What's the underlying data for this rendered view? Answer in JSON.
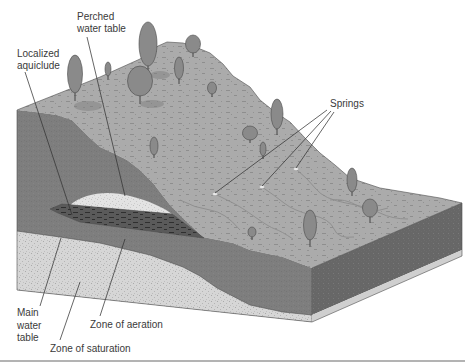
{
  "figure": {
    "labels": {
      "perched_water_table": {
        "line1": "Perched",
        "line2": "water table"
      },
      "localized_aquiclude": {
        "line1": "Localized",
        "line2": "aquiclude"
      },
      "springs": "Springs",
      "main_water_table": {
        "line1": "Main",
        "line2": "water",
        "line3": "table"
      },
      "zone_of_aeration": "Zone of aeration",
      "zone_of_saturation": "Zone of saturation"
    },
    "colors": {
      "top_surface": "#ababab",
      "front_face": "#7e7e7e",
      "right_face": "#676767",
      "zone_of_saturation": "#d6d6d6",
      "perched_lens": "#e3e3e3",
      "aquiclude": "#5a5a5a",
      "bottom_band": "#cfcfcf",
      "frame_line": "#9a9a9a"
    }
  }
}
